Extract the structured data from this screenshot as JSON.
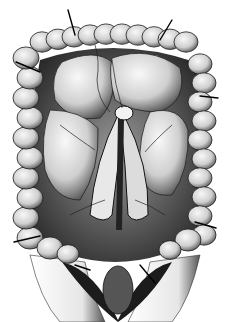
{
  "image": {
    "subject": "anatomical engraving of the large intestine (colon) framing the abdominal cavity, with mesentery, vessels and retractor pins",
    "style": "black-and-white stippled engraving",
    "colors": {
      "background": "#ffffff",
      "ink": "#111111",
      "mid_tone": "#6a6a6a",
      "light_tone": "#d9d9d9",
      "highlight": "#f4f4f4"
    }
  }
}
